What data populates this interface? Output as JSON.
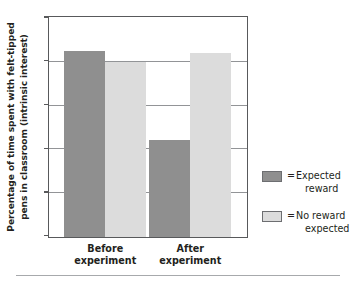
{
  "chart_data": {
    "type": "bar",
    "title": "",
    "xlabel": "",
    "ylabel": "Percentage of time spent with felt-tipped pens in classroom (intrinsic interest)",
    "ylabel_line1": "Percentage of time spent with felt-tipped",
    "ylabel_line2": "pens in classroom (intrinsic interest)",
    "categories": [
      "Before experiment",
      "After experiment"
    ],
    "category_lines": [
      [
        "Before",
        "experiment"
      ],
      [
        "After",
        "experiment"
      ]
    ],
    "series": [
      {
        "name": "Expected reward",
        "name_line1": "Expected",
        "name_line2": "reward",
        "color": "#8f8f8f",
        "values": [
          17.0,
          8.9
        ]
      },
      {
        "name": "No reward expected",
        "name_line1": "No reward",
        "name_line2": "expected",
        "color": "#dcdcdc",
        "values": [
          16.0,
          16.8
        ]
      }
    ],
    "ylim": [
      0,
      20
    ],
    "yticks": [
      0,
      4,
      8,
      12,
      16,
      20
    ],
    "ytick_labels": [
      "0",
      "4",
      "8",
      "12",
      "16",
      "20"
    ],
    "gridlines": [
      4,
      8,
      12,
      16
    ],
    "grid": true,
    "legend_position": "right",
    "legend_equals": "="
  }
}
